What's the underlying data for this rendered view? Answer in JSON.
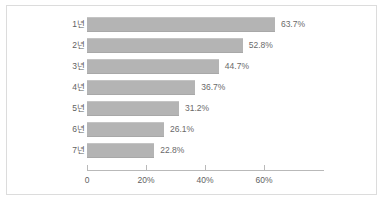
{
  "chart_data": {
    "type": "bar",
    "orientation": "horizontal",
    "title": "",
    "subtitle": "",
    "xlabel": "",
    "ylabel": "",
    "categories": [
      "1년",
      "2년",
      "3년",
      "4년",
      "5년",
      "6년",
      "7년"
    ],
    "values": [
      63.7,
      52.8,
      44.7,
      36.7,
      31.2,
      26.1,
      22.8
    ],
    "data_labels": [
      "63.7%",
      "52.8%",
      "44.7%",
      "36.7%",
      "31.2%",
      "26.1%",
      "22.8%"
    ],
    "xlim": [
      0,
      80
    ],
    "xticks": [
      0,
      20,
      40,
      60
    ],
    "xtick_labels": [
      "0",
      "20%",
      "40%",
      "60%"
    ],
    "grid": false,
    "legend": null,
    "series": [
      {
        "name": "",
        "values": [
          63.7,
          52.8,
          44.7,
          36.7,
          31.2,
          26.1,
          22.8
        ]
      }
    ],
    "colors": {
      "bar_fill": "#b4b4b4",
      "axis": "#b9b9b9",
      "frame_border": "#dcdcdc",
      "label_text": "#5f5f5f",
      "value_text": "#6a6a6a",
      "background": "#ffffff"
    },
    "scale": {
      "px_per_percent": 2.95,
      "origin_x_px": 80,
      "bar_height_px": 15,
      "row_pitch_px": 21,
      "first_row_top_px": 11
    }
  }
}
